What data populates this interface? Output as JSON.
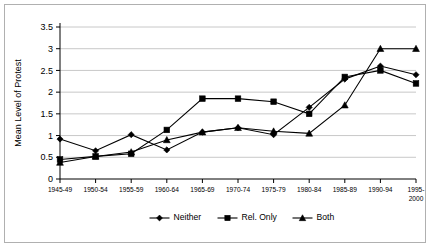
{
  "chart_data": {
    "type": "line",
    "title": "",
    "xlabel": "",
    "ylabel": "Mean Level of Protest",
    "ylim": [
      0,
      3.5
    ],
    "ytick_step": 0.5,
    "yticks": [
      "0",
      "0.5",
      "1",
      "1.5",
      "2",
      "2.5",
      "3",
      "3.5"
    ],
    "grid": true,
    "grid_orientation": "horizontal",
    "legend_position": "bottom",
    "categories": [
      "1945-49",
      "1950-54",
      "1955-59",
      "1960-64",
      "1965-69",
      "1970-74",
      "1975-79",
      "1980-84",
      "1985-89",
      "1990-94",
      "1995-2000"
    ],
    "series": [
      {
        "name": "Neither",
        "marker": "diamond",
        "color": "#000000",
        "values": [
          0.92,
          0.65,
          1.02,
          0.67,
          1.08,
          1.18,
          1.02,
          1.65,
          2.3,
          2.6,
          2.4
        ]
      },
      {
        "name": "Rel. Only",
        "marker": "square",
        "color": "#000000",
        "values": [
          0.45,
          0.52,
          0.58,
          1.13,
          1.85,
          1.85,
          1.78,
          1.5,
          2.35,
          2.5,
          2.2
        ]
      },
      {
        "name": "Both",
        "marker": "triangle",
        "color": "#000000",
        "values": [
          0.38,
          0.52,
          0.62,
          0.9,
          1.08,
          1.18,
          1.1,
          1.05,
          1.7,
          3.0,
          3.0
        ]
      }
    ]
  },
  "colors": {
    "line": "#000000",
    "gridline": "#c8c8c8",
    "axis": "#000000",
    "border": "#b0b0b0",
    "background": "#ffffff"
  },
  "legend": {
    "items": [
      {
        "label": "Neither",
        "marker": "diamond"
      },
      {
        "label": "Rel. Only",
        "marker": "square"
      },
      {
        "label": "Both",
        "marker": "triangle"
      }
    ]
  }
}
